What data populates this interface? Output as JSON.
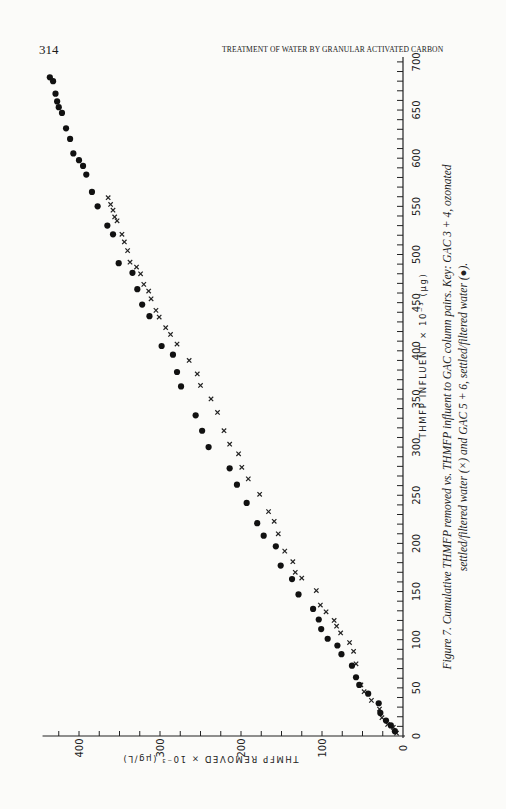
{
  "page": {
    "page_number": "314",
    "running_head": "TREATMENT OF WATER BY GRANULAR ACTIVATED CARBON"
  },
  "figure": {
    "caption_line1": "Figure 7.  Cumulative THMFP removed vs. THMFP influent to GAC column pairs. Key: GAC 3 + 4, ozonated",
    "caption_line2": "settled/filtered water (×) and GAC 5 + 6, settled/filtered water (●)."
  },
  "chart_data": {
    "type": "scatter",
    "orientation": "rotated 90° counter-clockwise on page",
    "title": "Cumulative THMFP removed vs. THMFP influent to GAC column pairs",
    "xlabel": "THMFP INFLUENT × 10⁻³ (µg)",
    "ylabel": "THMFP REMOVED × 10⁻³ (µg/L)",
    "xlim": [
      0,
      705
    ],
    "ylim": [
      0,
      445
    ],
    "x_ticks": [
      0,
      50,
      100,
      150,
      200,
      250,
      300,
      350,
      400,
      450,
      500,
      550,
      600,
      650,
      700
    ],
    "y_ticks": [
      0,
      100,
      200,
      300,
      400
    ],
    "x_minor_step": 10,
    "y_minor_step": 25,
    "grid": false,
    "series": [
      {
        "name": "GAC 3 + 4, ozonated settled/filtered water",
        "marker": "cross",
        "points": [
          [
            3,
            8
          ],
          [
            9,
            12
          ],
          [
            12,
            19
          ],
          [
            19,
            26
          ],
          [
            28,
            29
          ],
          [
            37,
            39
          ],
          [
            46,
            48
          ],
          [
            53,
            52
          ],
          [
            75,
            58
          ],
          [
            88,
            61
          ],
          [
            97,
            66
          ],
          [
            107,
            77
          ],
          [
            114,
            82
          ],
          [
            120,
            85
          ],
          [
            129,
            95
          ],
          [
            136,
            102
          ],
          [
            151,
            107
          ],
          [
            164,
            125
          ],
          [
            170,
            133
          ],
          [
            181,
            136
          ],
          [
            192,
            146
          ],
          [
            210,
            154
          ],
          [
            223,
            159
          ],
          [
            233,
            166
          ],
          [
            251,
            177
          ],
          [
            267,
            191
          ],
          [
            279,
            199
          ],
          [
            293,
            203
          ],
          [
            303,
            214
          ],
          [
            317,
            221
          ],
          [
            336,
            229
          ],
          [
            350,
            237
          ],
          [
            364,
            250
          ],
          [
            376,
            254
          ],
          [
            390,
            264
          ],
          [
            407,
            279
          ],
          [
            417,
            287
          ],
          [
            424,
            293
          ],
          [
            435,
            301
          ],
          [
            442,
            305
          ],
          [
            454,
            311
          ],
          [
            462,
            314
          ],
          [
            469,
            320
          ],
          [
            480,
            324
          ],
          [
            487,
            329
          ],
          [
            492,
            337
          ],
          [
            504,
            340
          ],
          [
            513,
            344
          ],
          [
            521,
            347
          ],
          [
            535,
            353
          ],
          [
            539,
            356
          ],
          [
            546,
            358
          ],
          [
            552,
            361
          ],
          [
            559,
            364
          ]
        ]
      },
      {
        "name": "GAC 5 + 6, settled/filtered water",
        "marker": "dot",
        "points": [
          [
            5,
            10
          ],
          [
            11,
            15
          ],
          [
            16,
            21
          ],
          [
            24,
            28
          ],
          [
            34,
            30
          ],
          [
            44,
            43
          ],
          [
            53,
            54
          ],
          [
            61,
            58
          ],
          [
            73,
            63
          ],
          [
            85,
            76
          ],
          [
            94,
            81
          ],
          [
            101,
            93
          ],
          [
            111,
            101
          ],
          [
            121,
            104
          ],
          [
            132,
            111
          ],
          [
            147,
            129
          ],
          [
            163,
            137
          ],
          [
            177,
            151
          ],
          [
            197,
            157
          ],
          [
            208,
            172
          ],
          [
            221,
            180
          ],
          [
            242,
            193
          ],
          [
            261,
            205
          ],
          [
            278,
            214
          ],
          [
            300,
            240
          ],
          [
            317,
            248
          ],
          [
            333,
            256
          ],
          [
            363,
            274
          ],
          [
            378,
            279
          ],
          [
            396,
            284
          ],
          [
            405,
            298
          ],
          [
            436,
            313
          ],
          [
            448,
            322
          ],
          [
            464,
            328
          ],
          [
            481,
            334
          ],
          [
            491,
            351
          ],
          [
            521,
            358
          ],
          [
            530,
            365
          ],
          [
            550,
            377
          ],
          [
            565,
            384
          ],
          [
            583,
            391
          ],
          [
            592,
            395
          ],
          [
            598,
            400
          ],
          [
            605,
            407
          ],
          [
            620,
            411
          ],
          [
            631,
            416
          ],
          [
            647,
            421
          ],
          [
            653,
            425
          ],
          [
            659,
            427
          ],
          [
            667,
            429
          ],
          [
            680,
            432
          ],
          [
            684,
            436
          ]
        ]
      }
    ]
  }
}
